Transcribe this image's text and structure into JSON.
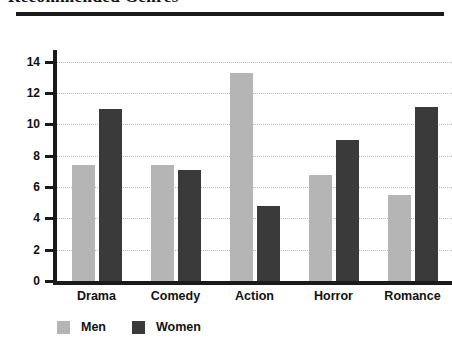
{
  "title": {
    "text": "Recommended Genres",
    "clipped": true
  },
  "legend": {
    "position": "bottom-left",
    "entries": [
      {
        "label": "Men",
        "color": "#b5b5b5"
      },
      {
        "label": "Women",
        "color": "#3a3a3a"
      }
    ]
  },
  "axis": {
    "y_ticks": [
      "0",
      "2",
      "4",
      "6",
      "8",
      "10",
      "12",
      "14"
    ]
  },
  "chart_data": {
    "type": "bar",
    "title": "Recommended Genres",
    "xlabel": "",
    "ylabel": "",
    "ylim": [
      0,
      14.875
    ],
    "ytick_step": 2,
    "grid": true,
    "legend_position": "bottom-left",
    "categories": [
      "Drama",
      "Comedy",
      "Action",
      "Horror",
      "Romance"
    ],
    "series": [
      {
        "name": "Men",
        "color": "#b5b5b5",
        "values": [
          7.4,
          7.4,
          13.3,
          6.8,
          5.5
        ]
      },
      {
        "name": "Women",
        "color": "#3a3a3a",
        "values": [
          11.0,
          7.1,
          4.8,
          9.0,
          11.1
        ]
      }
    ]
  }
}
